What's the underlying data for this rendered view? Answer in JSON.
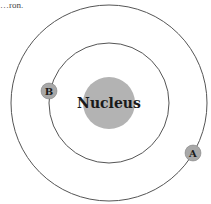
{
  "diagram": {
    "top_fragment": "…ron.",
    "nucleus": {
      "label": "Nucleus",
      "cx": 109,
      "cy": 103,
      "r": 26,
      "fill": "#b3b3b3"
    },
    "orbits": [
      {
        "name": "inner-orbit",
        "cx": 109,
        "cy": 103,
        "r": 60,
        "stroke": "#555555"
      },
      {
        "name": "outer-orbit",
        "cx": 109,
        "cy": 103,
        "r": 98,
        "stroke": "#555555"
      }
    ],
    "electrons": [
      {
        "label": "B",
        "orbit": "inner",
        "cx": 49,
        "cy": 91,
        "r": 8,
        "fill": "#a8a8a8"
      },
      {
        "label": "A",
        "orbit": "outer",
        "cx": 193,
        "cy": 153,
        "r": 8,
        "fill": "#a8a8a8"
      }
    ]
  }
}
